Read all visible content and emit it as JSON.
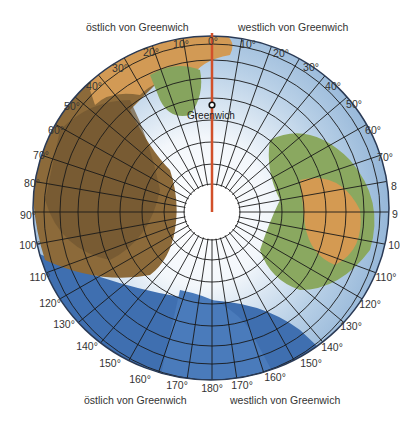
{
  "labels": {
    "top_left": "östlich von Greenwich",
    "top_right": "westlich von Greenwich",
    "bottom_left": "östlich von Greenwich",
    "bottom_right": "westlich von Greenwich",
    "greenwich": "Greenwich"
  },
  "degrees": {
    "d0": "0°",
    "e10": "10°",
    "e20": "20°",
    "e30": "30°",
    "e40": "40°",
    "e50": "50°",
    "e60": "60°",
    "e70": "70°",
    "e80": "80°",
    "e90": "90°",
    "e100": "100°",
    "e110": "110°",
    "e120": "120°",
    "e130": "130°",
    "e140": "140°",
    "e150": "150°",
    "e160": "160°",
    "e170": "170°",
    "d180": "180°",
    "w10": "10°",
    "w20": "20°",
    "w30": "30°",
    "w40": "40°",
    "w50": "50°",
    "w60": "60°",
    "w70": "70°",
    "w80": "8",
    "w90": "9",
    "w100": "10",
    "w110": "110°",
    "w120": "120°",
    "w130": "130°",
    "w140": "140°",
    "w150": "150°",
    "w160": "160°",
    "w170": "170°"
  },
  "colors": {
    "prime_meridian": "#d2502a",
    "ocean": "#3f6fb0",
    "ice": "#e8f0f6",
    "land_dry": "#c89a55",
    "land_green": "#8aa860",
    "grid": "#1a1a1a"
  }
}
